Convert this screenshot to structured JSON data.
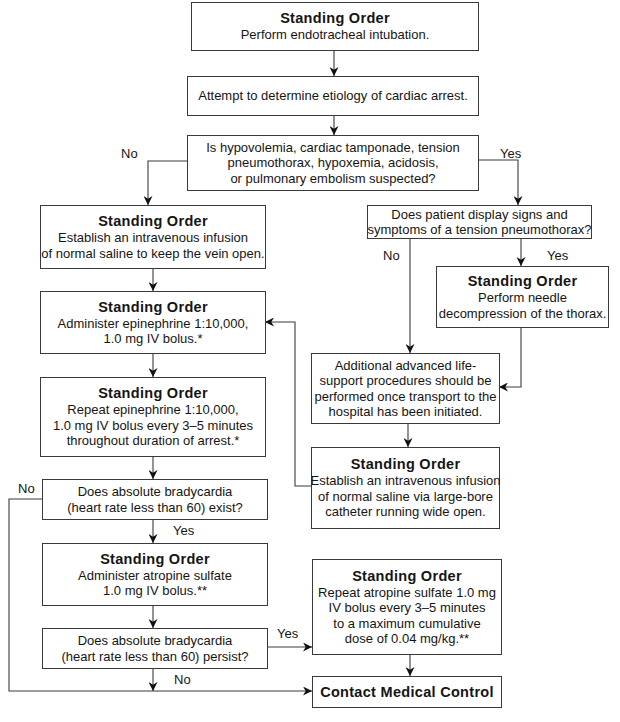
{
  "diagram": {
    "type": "flowchart",
    "nodes": {
      "n1": {
        "heading": "Standing Order",
        "lines": [
          "Perform endotracheal intubation."
        ]
      },
      "n2": {
        "lines": [
          "Attempt to determine etiology of cardiac arrest."
        ]
      },
      "n3": {
        "lines": [
          "Is hypovolemia, cardiac tamponade, tension",
          "pneumothorax, hypoxemia, acidosis,",
          "or pulmonary embolism suspected?"
        ]
      },
      "n4": {
        "heading": "Standing Order",
        "lines": [
          "Establish an intravenous infusion",
          "of normal saline to keep the vein open."
        ]
      },
      "n5": {
        "lines": [
          "Does patient display signs and",
          "symptoms of a tension pneumothorax?"
        ]
      },
      "n6": {
        "heading": "Standing Order",
        "lines": [
          "Perform needle",
          "decompression of the thorax."
        ]
      },
      "n7": {
        "heading": "Standing Order",
        "lines": [
          "Administer epinephrine 1:10,000,",
          "1.0 mg IV bolus.*"
        ]
      },
      "n8": {
        "lines": [
          "Additional advanced life-",
          "support procedures should be",
          "performed once transport to the",
          "hospital has been initiated."
        ]
      },
      "n9": {
        "heading": "Standing Order",
        "lines": [
          "Repeat epinephrine 1:10,000,",
          "1.0 mg IV bolus every 3–5 minutes",
          "throughout duration of arrest.*"
        ]
      },
      "n10": {
        "heading": "Standing Order",
        "lines": [
          "Establish an intravenous infusion",
          "of normal saline via large-bore",
          "catheter running wide open."
        ]
      },
      "n11": {
        "lines": [
          "Does absolute bradycardia",
          "(heart rate less than 60) exist?"
        ]
      },
      "n12": {
        "heading": "Standing Order",
        "lines": [
          "Administer atropine sulfate",
          "1.0 mg IV bolus.**"
        ]
      },
      "n13": {
        "heading": "Standing Order",
        "lines": [
          "Repeat atropine sulfate 1.0 mg",
          "IV bolus every 3–5 minutes",
          "to a maximum cumulative",
          "dose of 0.04 mg/kg.**"
        ]
      },
      "n14": {
        "lines": [
          "Does absolute bradycardia",
          "(heart rate less than 60) persist?"
        ]
      },
      "n15": {
        "heading": "Contact Medical Control"
      }
    },
    "edge_labels": {
      "n3_no": "No",
      "n3_yes": "Yes",
      "n5_no": "No",
      "n5_yes": "Yes",
      "n11_no": "No",
      "n11_yes": "Yes",
      "n14_yes": "Yes",
      "n14_no": "No"
    },
    "edges": [
      {
        "from": "n1",
        "to": "n2"
      },
      {
        "from": "n2",
        "to": "n3"
      },
      {
        "from": "n3",
        "to": "n4",
        "label": "No"
      },
      {
        "from": "n3",
        "to": "n5",
        "label": "Yes"
      },
      {
        "from": "n4",
        "to": "n7"
      },
      {
        "from": "n7",
        "to": "n9"
      },
      {
        "from": "n9",
        "to": "n11"
      },
      {
        "from": "n5",
        "to": "n8",
        "label": "No"
      },
      {
        "from": "n5",
        "to": "n6",
        "label": "Yes"
      },
      {
        "from": "n6",
        "to": "n8"
      },
      {
        "from": "n8",
        "to": "n10"
      },
      {
        "from": "n10",
        "to": "n7"
      },
      {
        "from": "n11",
        "to": "n12",
        "label": "Yes"
      },
      {
        "from": "n11",
        "to": "n15",
        "label": "No"
      },
      {
        "from": "n12",
        "to": "n14"
      },
      {
        "from": "n14",
        "to": "n13",
        "label": "Yes"
      },
      {
        "from": "n14",
        "to": "n15",
        "label": "No"
      },
      {
        "from": "n13",
        "to": "n15"
      }
    ]
  }
}
